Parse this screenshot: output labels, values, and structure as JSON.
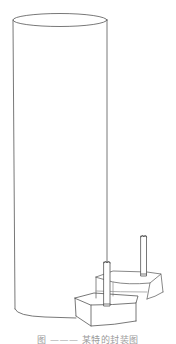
{
  "figure": {
    "stroke_color": "#555555",
    "light_stroke_color": "#8a8a8a",
    "parts": [
      {
        "name": "cylinder-body"
      },
      {
        "name": "lower-box"
      },
      {
        "name": "upper-box"
      },
      {
        "name": "front-pin"
      },
      {
        "name": "back-pin"
      }
    ]
  },
  "caption": {
    "text": "图 ——— 某特的封装图"
  }
}
